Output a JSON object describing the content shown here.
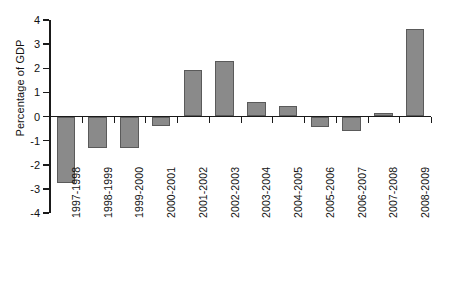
{
  "chart_data": {
    "type": "bar",
    "title": "",
    "subtitle": "",
    "xlabel": "",
    "ylabel": "Percentage of GDP",
    "ylim": [
      -4,
      4
    ],
    "yticks": [
      4,
      3,
      2,
      1,
      0,
      -1,
      -2,
      -3,
      -4
    ],
    "ytick_labels": [
      "4",
      "3",
      "2",
      "1",
      "0",
      "-1",
      "-2",
      "-3",
      "-4"
    ],
    "grid": false,
    "legend": null,
    "bar_color": "#8a8a8a",
    "bar_edge_color": "#5a5a5a",
    "axis_color": "#1a1a1a",
    "background": "#ffffff",
    "categories": [
      "1997-1998",
      "1998-1999",
      "1999-2000",
      "2000-2001",
      "2001-2002",
      "2002-2003",
      "2003-2004",
      "2004-2005",
      "2005-2006",
      "2006-2007",
      "2007-2008",
      "2008-2009"
    ],
    "values": [
      -2.75,
      -1.3,
      -1.3,
      -0.4,
      1.93,
      2.3,
      0.6,
      0.43,
      -0.42,
      -0.62,
      0.13,
      3.62
    ]
  }
}
